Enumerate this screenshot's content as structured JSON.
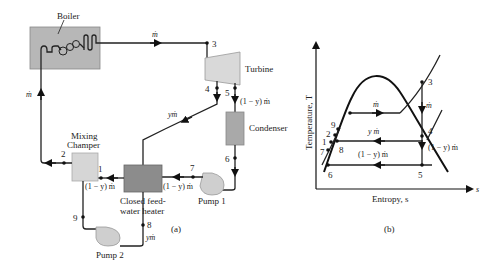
{
  "figure_a": {
    "caption": "(a)",
    "components": {
      "boiler": "Boiler",
      "turbine": "Turbine",
      "condenser": "Condenser",
      "mixing_chamber_line1": "Mixing",
      "mixing_chamber_line2": "Champer",
      "fwh_line1": "Closed feed-",
      "fwh_line2": "water heater",
      "pump1": "Pump 1",
      "pump2": "Pump 2"
    },
    "states": [
      "1",
      "2",
      "3",
      "4",
      "5",
      "6",
      "7",
      "8",
      "9"
    ],
    "flows": {
      "boiler_out": "ṁ",
      "boiler_in": "ṁ",
      "bleed": "yṁ",
      "turbine_exit": "(1 − y) ṁ",
      "pump1_out": "(1 − y) ṁ",
      "fwh_out": "(1 − y) ṁ",
      "pump2_in": "yṁ"
    },
    "colors": {
      "boiler": "#b7b7b7",
      "turbine": "#d9d9d9",
      "condenser": "#a9a9a9",
      "mixing": "#d6d6d6",
      "fwh": "#8c8c8c",
      "pump": "#cfcfcf"
    }
  },
  "figure_b": {
    "caption": "(b)",
    "y_axis_label": "Temperature, T",
    "x_axis_label": "Entropy, s",
    "x_axis_symbol": "s",
    "states": [
      "1",
      "2",
      "3",
      "4",
      "5",
      "6",
      "7",
      "8",
      "9"
    ],
    "flows": {
      "top": "ṁ",
      "expansion": "ṁ",
      "middle": "y ṁ",
      "after_bleed": "(1 − y) ṁ",
      "bottom": "(1 − y) ṁ"
    }
  }
}
